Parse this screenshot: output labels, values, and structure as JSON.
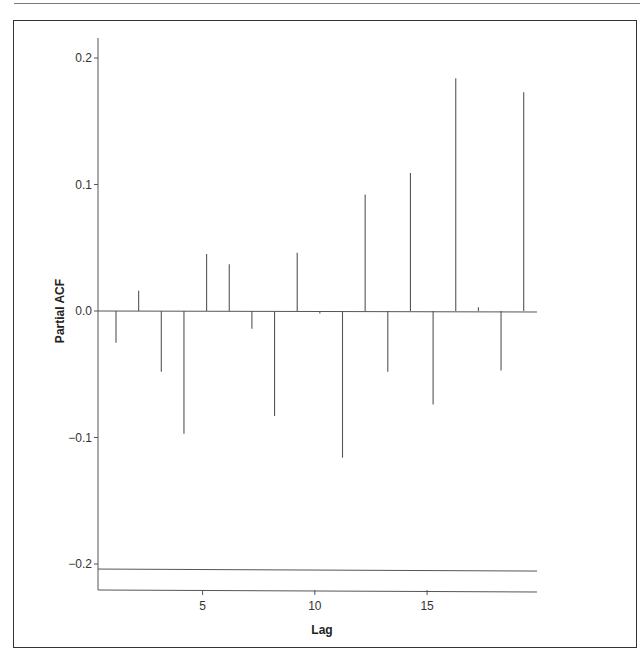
{
  "chart_data": {
    "type": "bar",
    "subtype": "partial-autocorrelation",
    "title": "",
    "xlabel": "Lag",
    "ylabel": "Partial ACF",
    "x": [
      1,
      2,
      3,
      4,
      5,
      6,
      7,
      8,
      9,
      10,
      11,
      12,
      13,
      14,
      15,
      16,
      17,
      18,
      19
    ],
    "values": [
      -0.025,
      0.016,
      -0.048,
      -0.097,
      0.045,
      0.037,
      -0.014,
      -0.083,
      0.046,
      -0.002,
      -0.116,
      0.092,
      -0.048,
      0.109,
      -0.074,
      0.184,
      0.003,
      -0.047,
      0.173
    ],
    "xticks": [
      5,
      10,
      15
    ],
    "xtick_labels": [
      "5",
      "10",
      "15"
    ],
    "yticks": [
      0.2,
      0.1,
      0.0,
      -0.1,
      -0.2
    ],
    "ytick_labels": [
      "0.2",
      "0.1",
      "0.0",
      "−0.1",
      "−0.2"
    ],
    "ylim": [
      -0.22,
      0.22
    ],
    "xlim": [
      0.5,
      19.6
    ],
    "reference_lines": [
      {
        "name": "zero-line",
        "y": 0.0
      },
      {
        "name": "lower-bound-line",
        "y": -0.204
      }
    ],
    "grid": false,
    "legend": null,
    "line_color": "#555555"
  }
}
